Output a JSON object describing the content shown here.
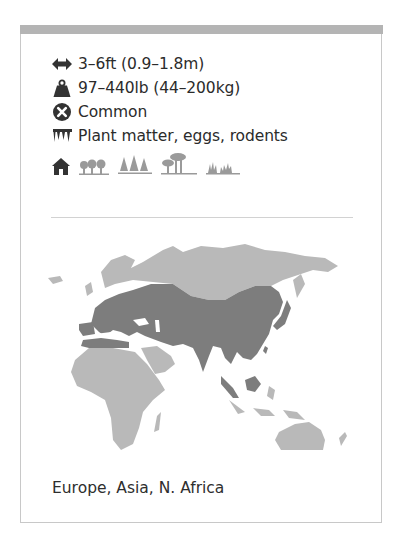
{
  "facts": {
    "length": {
      "icon": "length-arrows-icon",
      "text": "3–6ft (0.9–1.8m)"
    },
    "weight": {
      "icon": "weight-icon",
      "text": "97–440lb (44–200kg)"
    },
    "status": {
      "icon": "status-x-icon",
      "text": "Common"
    },
    "diet": {
      "icon": "diet-teeth-icon",
      "text": "Plant matter, eggs, rodents"
    }
  },
  "habitats": {
    "icon": "home-icon",
    "items": [
      "deciduous-forest-icon",
      "coniferous-forest-icon",
      "savanna-icon",
      "grassland-icon"
    ]
  },
  "map": {
    "land_color": "#b9b9b9",
    "range_color": "#7d7d7d",
    "legend": "range-map"
  },
  "range_text": "Europe, Asia, N. Africa",
  "colors": {
    "top_bar": "#b4b4b4",
    "border": "#c8c8c8",
    "icon_dark": "#333333",
    "icon_light": "#9a9a9a"
  }
}
